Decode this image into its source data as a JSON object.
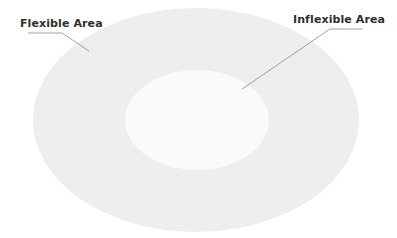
{
  "diagram": {
    "type": "concentric-ellipses",
    "colors": {
      "background": "#ffffff",
      "outer_fill": "#efefef",
      "inner_fill": "#fafafa",
      "leader_line": "#8a8a8a",
      "label_text": "#2e2e2e"
    },
    "regions": [
      {
        "id": "outer",
        "label": "Flexible Area"
      },
      {
        "id": "inner",
        "label": "Inflexible Area"
      }
    ],
    "labels": {
      "flexible": "Flexible Area",
      "inflexible": "Inflexible Area"
    }
  }
}
